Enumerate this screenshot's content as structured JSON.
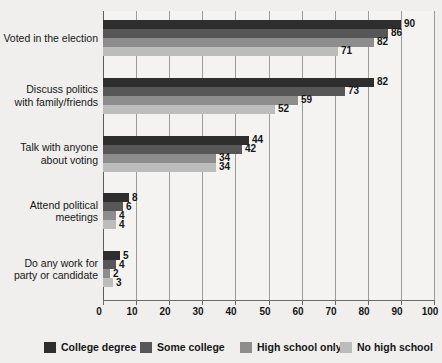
{
  "chart_data": {
    "type": "bar",
    "orientation": "horizontal",
    "title": "",
    "xlabel": "",
    "ylabel": "",
    "xlim": [
      0,
      100
    ],
    "xticks": [
      0,
      10,
      20,
      30,
      40,
      50,
      60,
      70,
      80,
      90,
      100
    ],
    "grid": true,
    "legend_position": "bottom",
    "categories": [
      "Voted in the election",
      "Discuss politics\nwith family/friends",
      "Talk with anyone\nabout voting",
      "Attend political\nmeetings",
      "Do any work for\nparty or candidate"
    ],
    "category_lines": [
      [
        "Voted in the election"
      ],
      [
        "Discuss politics",
        "with family/friends"
      ],
      [
        "Talk with anyone",
        "about voting"
      ],
      [
        "Attend political",
        "meetings"
      ],
      [
        "Do any work for",
        "party or candidate"
      ]
    ],
    "series": [
      {
        "name": "College degree",
        "color": "#2e2e2e",
        "values": [
          90,
          82,
          44,
          8,
          5
        ]
      },
      {
        "name": "Some college",
        "color": "#575757",
        "values": [
          86,
          73,
          42,
          6,
          4
        ]
      },
      {
        "name": "High school only",
        "color": "#8d8d8d",
        "values": [
          82,
          59,
          34,
          4,
          2
        ]
      },
      {
        "name": "No high school",
        "color": "#bcbcbc",
        "values": [
          71,
          52,
          34,
          4,
          3
        ]
      }
    ]
  },
  "legend": {
    "items": [
      {
        "label": "College degree",
        "color": "#2e2e2e"
      },
      {
        "label": "Some college",
        "color": "#575757"
      },
      {
        "label": "High school only",
        "color": "#8d8d8d"
      },
      {
        "label": "No high school",
        "color": "#bcbcbc"
      }
    ]
  },
  "axis": {
    "tick_labels": [
      "0",
      "10",
      "20",
      "30",
      "40",
      "50",
      "60",
      "70",
      "80",
      "90",
      "100"
    ]
  }
}
